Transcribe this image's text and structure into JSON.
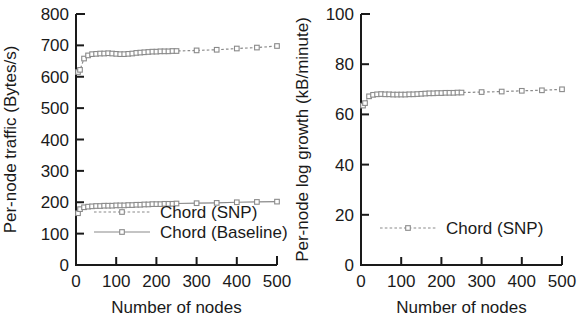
{
  "figure": {
    "background": "#ffffff",
    "ink": "#1a1a1a",
    "series_color": "#8a8a8a"
  },
  "chart_data": [
    {
      "type": "line",
      "panel": "left",
      "title": "",
      "xlabel": "Number of nodes",
      "ylabel": "Per-node traffic (Bytes/s)",
      "xlim": [
        0,
        500
      ],
      "ylim": [
        0,
        800
      ],
      "xticks": [
        0,
        100,
        200,
        300,
        400,
        500
      ],
      "yticks": [
        0,
        100,
        200,
        300,
        400,
        500,
        600,
        700,
        800
      ],
      "xticklabels": [
        "0",
        "100",
        "200",
        "300",
        "400",
        "500"
      ],
      "yticklabels": [
        "0",
        "100",
        "200",
        "300",
        "400",
        "500",
        "600",
        "700",
        "800"
      ],
      "grid": false,
      "legend_position": "lower center inside",
      "marker": "open-square",
      "series": [
        {
          "name": "Chord (SNP)",
          "linestyle": "dotted",
          "x": [
            5,
            10,
            20,
            30,
            40,
            50,
            60,
            70,
            80,
            90,
            100,
            110,
            120,
            130,
            140,
            150,
            160,
            170,
            180,
            190,
            200,
            210,
            220,
            230,
            240,
            250,
            300,
            350,
            400,
            450,
            500
          ],
          "values": [
            615,
            622,
            658,
            668,
            672,
            673,
            674,
            674,
            675,
            674,
            673,
            672,
            672,
            673,
            674,
            676,
            677,
            678,
            679,
            680,
            680,
            681,
            681,
            681,
            682,
            682,
            684,
            686,
            690,
            693,
            698
          ]
        },
        {
          "name": "Chord (Baseline)",
          "linestyle": "solid",
          "x": [
            5,
            10,
            20,
            30,
            40,
            50,
            60,
            70,
            80,
            90,
            100,
            110,
            120,
            130,
            140,
            150,
            160,
            170,
            180,
            190,
            200,
            210,
            220,
            230,
            240,
            250,
            300,
            350,
            400,
            450,
            500
          ],
          "values": [
            165,
            178,
            184,
            186,
            187,
            188,
            188,
            189,
            189,
            189,
            190,
            190,
            190,
            191,
            191,
            192,
            192,
            193,
            193,
            194,
            194,
            194,
            195,
            195,
            195,
            196,
            197,
            198,
            200,
            201,
            202
          ]
        }
      ]
    },
    {
      "type": "line",
      "panel": "right",
      "title": "",
      "xlabel": "Number of nodes",
      "ylabel": "Per-node log growth (kB/minute)",
      "xlim": [
        0,
        500
      ],
      "ylim": [
        0,
        100
      ],
      "xticks": [
        0,
        100,
        200,
        300,
        400,
        500
      ],
      "yticks": [
        0,
        20,
        40,
        60,
        80,
        100
      ],
      "xticklabels": [
        "0",
        "100",
        "200",
        "300",
        "400",
        "500"
      ],
      "yticklabels": [
        "0",
        "20",
        "40",
        "60",
        "80",
        "100"
      ],
      "grid": false,
      "legend_position": "lower center inside",
      "marker": "open-square",
      "series": [
        {
          "name": "Chord (SNP)",
          "linestyle": "dotted",
          "x": [
            5,
            10,
            20,
            30,
            40,
            50,
            60,
            70,
            80,
            90,
            100,
            110,
            120,
            130,
            140,
            150,
            160,
            170,
            180,
            190,
            200,
            210,
            220,
            230,
            240,
            250,
            300,
            350,
            400,
            450,
            500
          ],
          "values": [
            63.5,
            64.5,
            67.2,
            67.8,
            68.0,
            68.1,
            68.0,
            68.0,
            67.9,
            67.9,
            67.9,
            67.9,
            68.0,
            68.0,
            68.1,
            68.2,
            68.3,
            68.4,
            68.4,
            68.5,
            68.5,
            68.6,
            68.6,
            68.6,
            68.7,
            68.7,
            68.9,
            69.1,
            69.4,
            69.6,
            70.0
          ]
        }
      ]
    }
  ]
}
